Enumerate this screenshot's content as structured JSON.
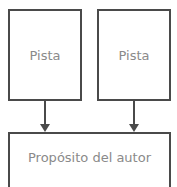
{
  "diagram": {
    "nodes": [
      {
        "id": "clue-1",
        "label": "Pista"
      },
      {
        "id": "clue-2",
        "label": "Pista"
      },
      {
        "id": "authors-purpose",
        "label": "Propósito del autor"
      }
    ],
    "edges": [
      {
        "from": "clue-1",
        "to": "authors-purpose"
      },
      {
        "from": "clue-2",
        "to": "authors-purpose"
      }
    ],
    "colors": {
      "border": "#4a4a4a",
      "text": "#8a8a8a"
    }
  }
}
